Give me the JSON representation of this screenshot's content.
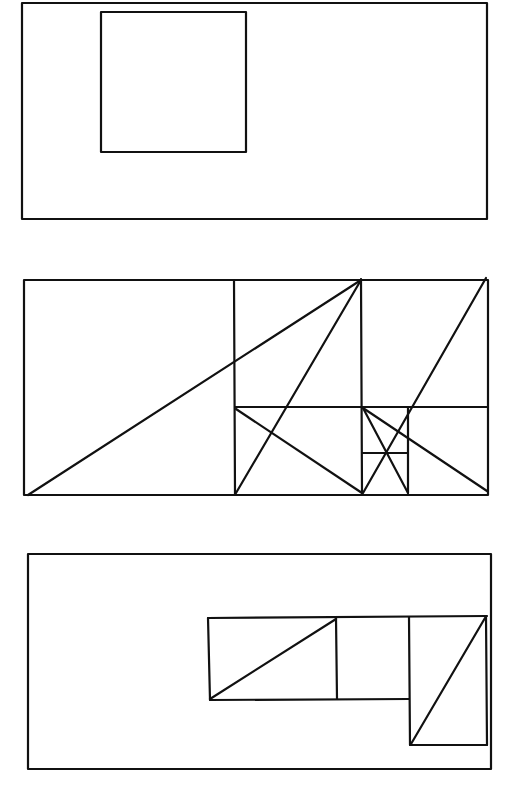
{
  "figure": {
    "title": "Golden rectangle subdivision diagrams",
    "stroke_color": "#111111",
    "background": "#ffffff"
  },
  "panels": [
    {
      "name": "panel-1",
      "description": "Rectangle with an inscribed square placed near upper-left",
      "outer": {
        "x1": 22,
        "y1": 3,
        "x2": 487,
        "y2": 219
      },
      "rects": [
        {
          "x1": 101,
          "y1": 12,
          "x2": 246,
          "y2": 152
        }
      ],
      "lines": []
    },
    {
      "name": "panel-2",
      "description": "Golden rectangle recursively subdivided into squares with construction diagonals",
      "outer": {
        "x1": 24,
        "y1": 280,
        "x2": 488,
        "y2": 495
      },
      "rects": [],
      "lines": [
        {
          "x1": 234,
          "y1": 280,
          "x2": 235,
          "y2": 494
        },
        {
          "x1": 361,
          "y1": 279,
          "x2": 362,
          "y2": 493
        },
        {
          "x1": 235,
          "y1": 407,
          "x2": 488,
          "y2": 407
        },
        {
          "x1": 408,
          "y1": 407,
          "x2": 408,
          "y2": 493
        },
        {
          "x1": 362,
          "y1": 453,
          "x2": 408,
          "y2": 453
        },
        {
          "x1": 28,
          "y1": 495,
          "x2": 361,
          "y2": 280
        },
        {
          "x1": 236,
          "y1": 493,
          "x2": 361,
          "y2": 280
        },
        {
          "x1": 236,
          "y1": 409,
          "x2": 362,
          "y2": 493
        },
        {
          "x1": 363,
          "y1": 493,
          "x2": 486,
          "y2": 278
        },
        {
          "x1": 363,
          "y1": 408,
          "x2": 408,
          "y2": 493
        },
        {
          "x1": 363,
          "y1": 408,
          "x2": 487,
          "y2": 491
        }
      ]
    },
    {
      "name": "panel-3",
      "description": "Rectangle containing an L-shaped arrangement of golden sub-rectangles with diagonals",
      "outer": {
        "x1": 28,
        "y1": 554,
        "x2": 491,
        "y2": 769
      },
      "rects": [],
      "lines": [
        {
          "x1": 208,
          "y1": 618,
          "x2": 487,
          "y2": 616
        },
        {
          "x1": 208,
          "y1": 618,
          "x2": 210,
          "y2": 700
        },
        {
          "x1": 210,
          "y1": 700,
          "x2": 409,
          "y2": 699
        },
        {
          "x1": 336,
          "y1": 618,
          "x2": 337,
          "y2": 699
        },
        {
          "x1": 409,
          "y1": 617,
          "x2": 410,
          "y2": 745
        },
        {
          "x1": 410,
          "y1": 745,
          "x2": 487,
          "y2": 745
        },
        {
          "x1": 486,
          "y1": 616,
          "x2": 487,
          "y2": 745
        },
        {
          "x1": 210,
          "y1": 699,
          "x2": 336,
          "y2": 619
        },
        {
          "x1": 411,
          "y1": 744,
          "x2": 485,
          "y2": 618
        }
      ]
    }
  ]
}
